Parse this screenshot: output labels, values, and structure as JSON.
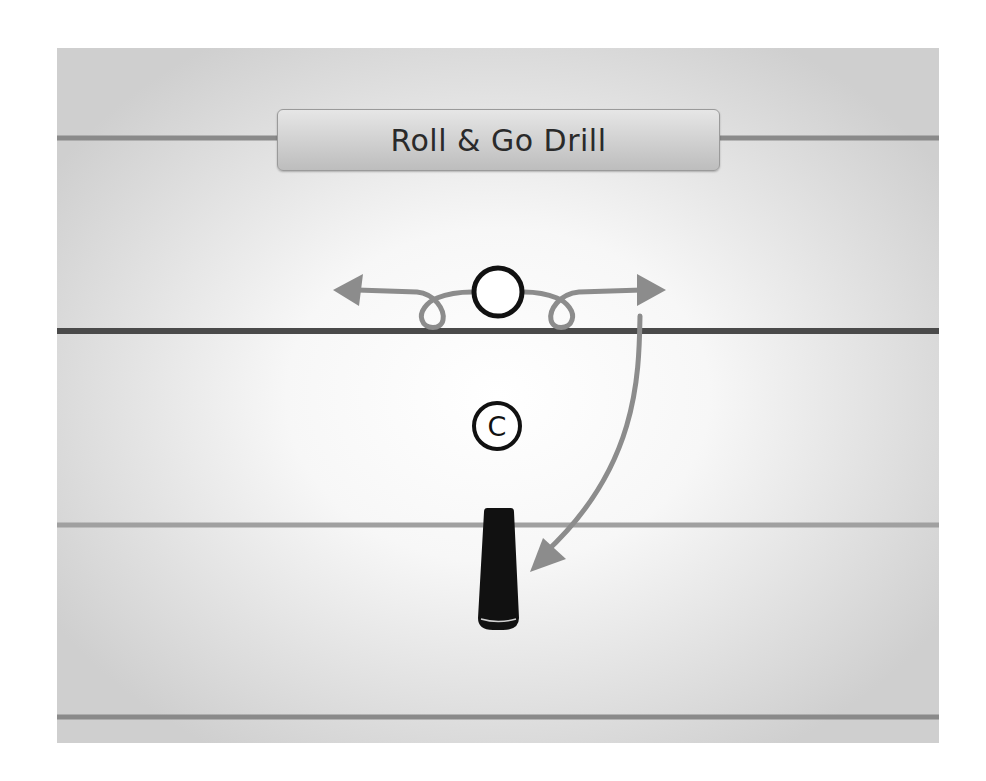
{
  "title": "Roll & Go Drill",
  "diagram": {
    "field_lines": [
      {
        "name": "top-line",
        "y": 90,
        "color": "#8a8a8a",
        "width": 5
      },
      {
        "name": "line-of-scrimmage",
        "y": 283,
        "color": "#4a4a4a",
        "width": 6
      },
      {
        "name": "middle-line",
        "y": 477,
        "color": "#9a9a9a",
        "width": 5
      },
      {
        "name": "bottom-line",
        "y": 669,
        "color": "#8a8a8a",
        "width": 5
      }
    ],
    "players": [
      {
        "name": "player-circle",
        "label": "",
        "cx": 441,
        "cy": 244,
        "r": 26
      },
      {
        "name": "coach-circle",
        "label": "C",
        "cx": 440,
        "cy": 378,
        "r": 25
      }
    ],
    "cone": {
      "name": "cone",
      "color": "#111111"
    },
    "path_color": "#8c8c8c",
    "player_color": "#111111"
  }
}
